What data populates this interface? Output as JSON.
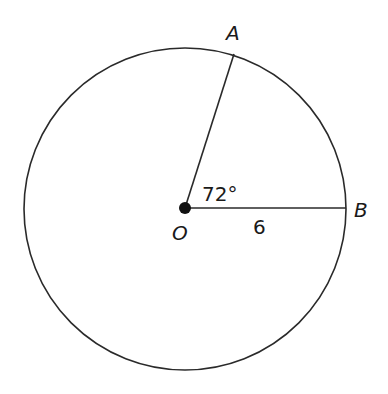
{
  "diagram": {
    "type": "circle-sector",
    "center": {
      "label": "O",
      "x": 185,
      "y": 208
    },
    "radius_px": 162,
    "points": [
      {
        "label": "A",
        "angle_deg": 72
      },
      {
        "label": "B",
        "angle_deg": 0
      }
    ],
    "angle_label": "72°",
    "radius_label": "6",
    "colors": {
      "stroke": "#2a2a2a",
      "text": "#1a1a1a",
      "background": "#ffffff"
    }
  }
}
